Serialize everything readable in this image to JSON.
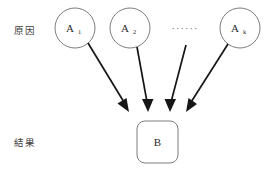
{
  "diagram": {
    "background_color": "#ffffff",
    "rows": [
      {
        "id": "cause",
        "label": "原因",
        "x": 14,
        "y": 34
      },
      {
        "id": "effect",
        "label": "結果",
        "x": 14,
        "y": 146
      }
    ],
    "cause_nodes": [
      {
        "id": "a1",
        "label": "A",
        "subscript": "1",
        "shape": "circle",
        "cx": 75,
        "cy": 28,
        "r": 20
      },
      {
        "id": "a2",
        "label": "A",
        "subscript": "2",
        "shape": "circle",
        "cx": 130,
        "cy": 28,
        "r": 20
      },
      {
        "id": "ak",
        "label": "A",
        "subscript": "k",
        "shape": "circle",
        "cx": 240,
        "cy": 28,
        "r": 20
      }
    ],
    "ellipsis": {
      "id": "more-causes",
      "text": "······",
      "x": 185,
      "y": 32
    },
    "effect_node": {
      "id": "b",
      "label": "B",
      "shape": "rounded-rect",
      "x": 137,
      "y": 121,
      "width": 41,
      "height": 42,
      "corner_radius": 8
    },
    "edges": [
      {
        "id": "a1-b",
        "from": "a1",
        "to": "b",
        "x1": 88,
        "y1": 43,
        "x2": 129,
        "y2": 111
      },
      {
        "id": "a2-b",
        "from": "a2",
        "to": "b",
        "x1": 137,
        "y1": 47,
        "x2": 148,
        "y2": 111
      },
      {
        "id": "ellipsis-b",
        "from": "more-causes",
        "to": "b",
        "x1": 186,
        "y1": 45,
        "x2": 170,
        "y2": 111
      },
      {
        "id": "ak-b",
        "from": "ak",
        "to": "b",
        "x1": 228,
        "y1": 44,
        "x2": 186,
        "y2": 111
      }
    ],
    "colors": {
      "node_stroke": "#6e6e6e",
      "node_fill": "#ffffff",
      "edge": "#161616",
      "label_text": "#3b3b3b",
      "node_text": "#2b2b2b"
    }
  }
}
